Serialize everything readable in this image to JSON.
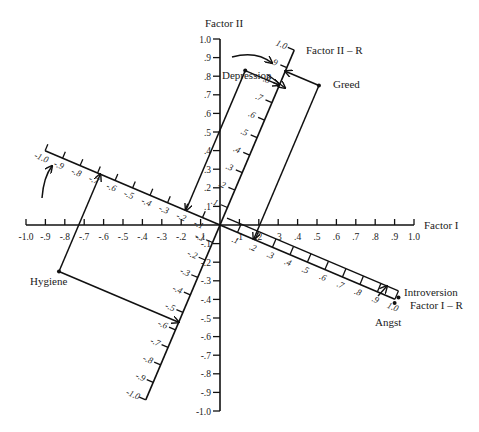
{
  "diagram": {
    "type": "factor-rotation",
    "axes": {
      "factor_i": {
        "label": "Factor I",
        "min": -1.0,
        "max": 1.0,
        "step": 0.1
      },
      "factor_ii": {
        "label": "Factor II",
        "min": -1.0,
        "max": 1.0,
        "step": 0.1
      },
      "factor_i_r": {
        "label": "Factor I – R",
        "min": -1.0,
        "max": 1.0,
        "step": 0.1
      },
      "factor_ii_r": {
        "label": "Factor II – R",
        "min": -1.0,
        "max": 1.0,
        "step": 0.1
      }
    },
    "x_tick_labels": [
      "-1.0",
      "-.9",
      "-.8",
      "-.7",
      "-.6",
      "-.5",
      "-.4",
      "-.3",
      "-.2",
      "-.1",
      ".1",
      ".2",
      ".3",
      ".4",
      ".5",
      ".6",
      ".7",
      ".8",
      ".9",
      "1.0"
    ],
    "y_tick_labels": [
      "1.0",
      ".9",
      ".8",
      ".7",
      ".6",
      ".5",
      ".4",
      ".3",
      ".2",
      ".1",
      "-.1",
      "-.2",
      "-.3",
      "-.4",
      "-.5",
      "-.6",
      "-.7",
      "-.8",
      "-.9",
      "-1.0"
    ],
    "rotation_degrees": 23,
    "points": [
      {
        "name": "Depression",
        "factor_i": 0.13,
        "factor_ii": 0.83
      },
      {
        "name": "Greed",
        "factor_i": 0.51,
        "factor_ii": 0.75
      },
      {
        "name": "Hygiene",
        "factor_i": -0.83,
        "factor_ii": -0.25
      },
      {
        "name": "Introversion",
        "factor_i": 0.92,
        "factor_ii": -0.39
      },
      {
        "name": "Angst",
        "factor_i": 0.9,
        "factor_ii": -0.42
      }
    ],
    "labels": {
      "depression": "Depression",
      "greed": "Greed",
      "hygiene": "Hygiene",
      "introversion": "Introversion",
      "angst": "Angst"
    }
  }
}
